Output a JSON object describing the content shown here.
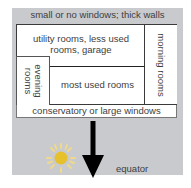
{
  "diagram": {
    "top_label": "small or no windows; thick walls",
    "rooms": {
      "utility": {
        "line1": "utility rooms, less used",
        "line2": "rooms, garage"
      },
      "morning": "morning rooms",
      "evening": {
        "line1": "evening",
        "line2": "rooms"
      },
      "most_used": "most used rooms"
    },
    "bottom_label": "conservatory or large windows",
    "arrow_label": "equator",
    "icons": {
      "sun": "sun-icon",
      "arrow": "arrow-down-icon"
    },
    "colors": {
      "background": "#c9cace",
      "sun": "#e8c32e",
      "sun_rays": "#f0dc8a",
      "arrow": "#000000"
    }
  }
}
